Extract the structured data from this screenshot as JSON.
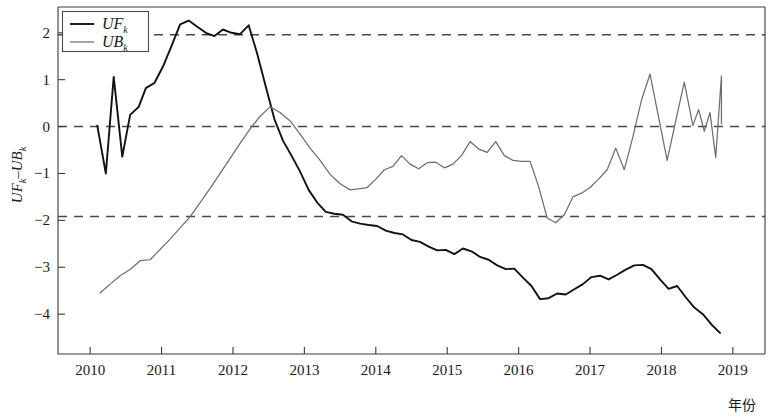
{
  "chart_data": {
    "type": "line",
    "title": "",
    "xlabel": "年份",
    "ylabel": "UF_k − UB_k",
    "ylabel_parts": {
      "a": "UF",
      "a_sub": "k",
      "dash": "–",
      "b": "UB",
      "b_sub": "k"
    },
    "xlim": [
      2009.55,
      2019.45
    ],
    "ylim": [
      -4.85,
      2.55
    ],
    "xticks": [
      2010,
      2011,
      2012,
      2013,
      2014,
      2015,
      2016,
      2017,
      2018,
      2019
    ],
    "xtick_labels": [
      "2010",
      "2011",
      "2012",
      "2013",
      "2014",
      "2015",
      "2016",
      "2017",
      "2018",
      "2019"
    ],
    "yticks": [
      2,
      1,
      0,
      -1,
      -2,
      -3,
      -4
    ],
    "ytick_labels": [
      "2",
      "1",
      "0",
      "−1",
      "−2",
      "−3",
      "−4"
    ],
    "grid": false,
    "legend_position": "top-left",
    "reference_lines": [
      {
        "name": "upper-confidence",
        "value": 1.96,
        "style": "dashed",
        "color": "#4a4a4a"
      },
      {
        "name": "zero-line",
        "value": 0,
        "style": "dashed",
        "color": "#4a4a4a"
      },
      {
        "name": "lower-confidence",
        "value": -1.92,
        "style": "dashed",
        "color": "#4a4a4a"
      }
    ],
    "series": [
      {
        "name": "UF_k",
        "label": "UF",
        "label_sub": "k",
        "color": "#121212",
        "x": [
          2010.1,
          2010.22,
          2010.33,
          2010.45,
          2010.56,
          2010.68,
          2010.78,
          2010.9,
          2011.02,
          2011.14,
          2011.26,
          2011.38,
          2011.5,
          2011.62,
          2011.74,
          2011.86,
          2011.98,
          2012.1,
          2012.22,
          2012.34,
          2012.46,
          2012.58,
          2012.7,
          2012.82,
          2012.94,
          2013.06,
          2013.18,
          2013.3,
          2013.42,
          2013.54,
          2013.66,
          2013.78,
          2013.9,
          2014.02,
          2014.14,
          2014.26,
          2014.38,
          2014.5,
          2014.62,
          2014.74,
          2014.86,
          2014.98,
          2015.1,
          2015.22,
          2015.34,
          2015.46,
          2015.58,
          2015.7,
          2015.82,
          2015.94,
          2016.06,
          2016.18,
          2016.3,
          2016.42,
          2016.54,
          2016.66,
          2016.78,
          2016.9,
          2017.02,
          2017.14,
          2017.26,
          2017.38,
          2017.5,
          2017.62,
          2017.74,
          2017.86,
          2017.98,
          2018.1,
          2018.22,
          2018.34,
          2018.46,
          2018.58,
          2018.7,
          2018.82
        ],
        "y": [
          0.02,
          -1.0,
          1.06,
          -0.64,
          0.25,
          0.42,
          0.82,
          0.93,
          1.28,
          1.72,
          2.18,
          2.26,
          2.13,
          2.0,
          1.93,
          2.07,
          2.0,
          1.97,
          2.16,
          1.55,
          0.85,
          0.16,
          -0.3,
          -0.62,
          -0.96,
          -1.35,
          -1.62,
          -1.82,
          -1.86,
          -1.88,
          -2.02,
          -2.07,
          -2.1,
          -2.12,
          -2.22,
          -2.27,
          -2.3,
          -2.42,
          -2.46,
          -2.56,
          -2.64,
          -2.63,
          -2.72,
          -2.6,
          -2.66,
          -2.78,
          -2.84,
          -2.96,
          -3.04,
          -3.03,
          -3.22,
          -3.4,
          -3.68,
          -3.66,
          -3.56,
          -3.58,
          -3.47,
          -3.36,
          -3.21,
          -3.18,
          -3.26,
          -3.16,
          -3.05,
          -2.96,
          -2.95,
          -3.04,
          -3.26,
          -3.46,
          -3.4,
          -3.64,
          -3.86,
          -4.0,
          -4.22,
          -4.4
        ]
      },
      {
        "name": "UB_k",
        "label": "UB",
        "label_sub": "k",
        "color": "#6e6e6e",
        "x": [
          2010.14,
          2010.28,
          2010.42,
          2010.56,
          2010.7,
          2010.84,
          2010.98,
          2011.12,
          2011.26,
          2011.4,
          2011.54,
          2011.68,
          2011.82,
          2011.96,
          2012.1,
          2012.24,
          2012.38,
          2012.52,
          2012.66,
          2012.8,
          2012.94,
          2013.08,
          2013.22,
          2013.36,
          2013.5,
          2013.64,
          2013.76,
          2013.88,
          2014.0,
          2014.12,
          2014.24,
          2014.36,
          2014.48,
          2014.6,
          2014.72,
          2014.84,
          2014.96,
          2015.08,
          2015.2,
          2015.32,
          2015.44,
          2015.56,
          2015.68,
          2015.8,
          2015.92,
          2016.04,
          2016.16,
          2016.28,
          2016.4,
          2016.52,
          2016.64,
          2016.76,
          2016.88,
          2017.0,
          2017.12,
          2017.24,
          2017.36,
          2017.48,
          2017.6,
          2017.72,
          2017.84,
          2017.96,
          2018.08,
          2018.2,
          2018.32,
          2018.44,
          2018.52,
          2018.6,
          2018.68,
          2018.76,
          2018.84
        ],
        "y": [
          -3.55,
          -3.36,
          -3.18,
          -3.05,
          -2.86,
          -2.84,
          -2.62,
          -2.4,
          -2.16,
          -1.92,
          -1.62,
          -1.32,
          -1.0,
          -0.68,
          -0.36,
          -0.05,
          0.22,
          0.42,
          0.3,
          0.12,
          -0.16,
          -0.46,
          -0.72,
          -1.02,
          -1.22,
          -1.35,
          -1.33,
          -1.3,
          -1.12,
          -0.92,
          -0.85,
          -0.62,
          -0.8,
          -0.9,
          -0.77,
          -0.76,
          -0.88,
          -0.8,
          -0.62,
          -0.32,
          -0.48,
          -0.55,
          -0.32,
          -0.62,
          -0.72,
          -0.74,
          -0.74,
          -1.28,
          -1.95,
          -2.05,
          -1.88,
          -1.5,
          -1.42,
          -1.3,
          -1.12,
          -0.92,
          -0.46,
          -0.92,
          -0.22,
          0.56,
          1.12,
          0.2,
          -0.72,
          0.12,
          0.95,
          0.02,
          0.36,
          -0.1,
          0.3,
          -0.66,
          1.08
        ],
        "y_end": 0.06
      }
    ]
  },
  "legend": {
    "entries": [
      {
        "name": "legend-entry-uf",
        "label": "UF",
        "sub": "k",
        "color": "#121212"
      },
      {
        "name": "legend-entry-ub",
        "label": "UB",
        "sub": "k",
        "color": "#6e6e6e"
      }
    ]
  },
  "colors": {
    "background": "#ffffff",
    "axis": "#3a3a3a",
    "uf_line": "#121212",
    "ub_line": "#6e6e6e",
    "reference_dash": "#4a4a4a"
  }
}
